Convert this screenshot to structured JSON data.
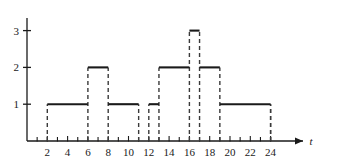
{
  "chart_data": {
    "type": "line",
    "title": "",
    "xlabel": "t",
    "ylabel": "",
    "xlim": [
      0,
      26
    ],
    "ylim": [
      0,
      3.6
    ],
    "grid": false,
    "legend": null,
    "step_style": "post",
    "line_style": {
      "horizontal": "solid",
      "vertical": "dashed",
      "color": "#1a1a1a"
    },
    "x_ticks_all": [
      1,
      2,
      3,
      4,
      5,
      6,
      7,
      8,
      9,
      10,
      11,
      12,
      13,
      14,
      15,
      16,
      17,
      18,
      19,
      20,
      21,
      22,
      23,
      24
    ],
    "x_tick_labels": [
      "2",
      "4",
      "6",
      "8",
      "10",
      "12",
      "14",
      "16",
      "18",
      "20",
      "22",
      "24"
    ],
    "x_tick_label_values": [
      2,
      4,
      6,
      8,
      10,
      12,
      14,
      16,
      18,
      20,
      22,
      24
    ],
    "y_ticks": [
      1,
      2,
      3
    ],
    "y_tick_labels": [
      "1",
      "2",
      "3"
    ],
    "segments": [
      {
        "start": 0,
        "end": 2,
        "value": 0
      },
      {
        "start": 2,
        "end": 6,
        "value": 1
      },
      {
        "start": 6,
        "end": 8,
        "value": 2
      },
      {
        "start": 8,
        "end": 11,
        "value": 1
      },
      {
        "start": 11,
        "end": 12,
        "value": 0
      },
      {
        "start": 12,
        "end": 13,
        "value": 1
      },
      {
        "start": 13,
        "end": 16,
        "value": 2
      },
      {
        "start": 16,
        "end": 17,
        "value": 3
      },
      {
        "start": 17,
        "end": 19,
        "value": 2
      },
      {
        "start": 19,
        "end": 24,
        "value": 1
      },
      {
        "start": 24,
        "end": 26,
        "value": 0
      }
    ],
    "x": [
      0,
      2,
      6,
      8,
      11,
      12,
      13,
      16,
      17,
      19,
      24
    ],
    "values": [
      0,
      1,
      2,
      1,
      0,
      1,
      2,
      3,
      2,
      1,
      0
    ]
  },
  "axis": {
    "x_axis_label": "t",
    "arrow": "right-arrow"
  }
}
